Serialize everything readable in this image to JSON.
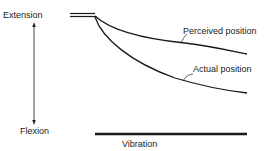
{
  "diagram": {
    "labels": {
      "extension": "Extension",
      "flexion": "Flexion",
      "perceived": "Perceived position",
      "actual": "Actual position",
      "vibration": "Vibration"
    },
    "colors": {
      "line": "#1a1a1a",
      "text": "#222222",
      "background": "#ffffff"
    }
  }
}
